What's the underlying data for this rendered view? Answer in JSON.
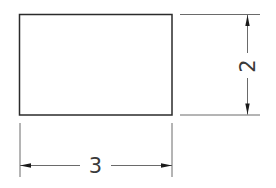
{
  "drawing": {
    "type": "technical-dimension-drawing",
    "shape": "rectangle",
    "dimensions": {
      "width": {
        "label": "3",
        "orientation": "horizontal",
        "position": "below"
      },
      "height": {
        "label": "2",
        "orientation": "vertical",
        "position": "right"
      }
    },
    "colors": {
      "outline": "#2b2b2b",
      "dimension_lines": "#6a6a6a",
      "arrowheads": "#1a1a1a",
      "text": "#3a3a3a",
      "background": "#ffffff"
    }
  }
}
